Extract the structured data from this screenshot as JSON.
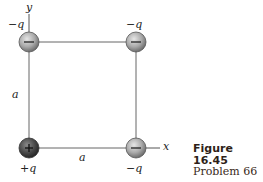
{
  "figure": {
    "title": "Figure 16.45",
    "subtitle": "Problem 66"
  },
  "axes": {
    "x_label": "x",
    "y_label": "y"
  },
  "square": {
    "side_label_left": "a",
    "side_label_bottom": "a"
  },
  "charges": [
    {
      "position": "top-left",
      "label": "−q",
      "sign": "−"
    },
    {
      "position": "top-right",
      "label": "−q",
      "sign": "−"
    },
    {
      "position": "bottom-left",
      "label": "+q",
      "sign": "+"
    },
    {
      "position": "bottom-right",
      "label": "−q",
      "sign": "−"
    }
  ],
  "colors": {
    "line": "#555555",
    "negative_charge": "#a8a8a8",
    "positive_charge": "#4a4a4a",
    "caption": "#2e1f18"
  }
}
